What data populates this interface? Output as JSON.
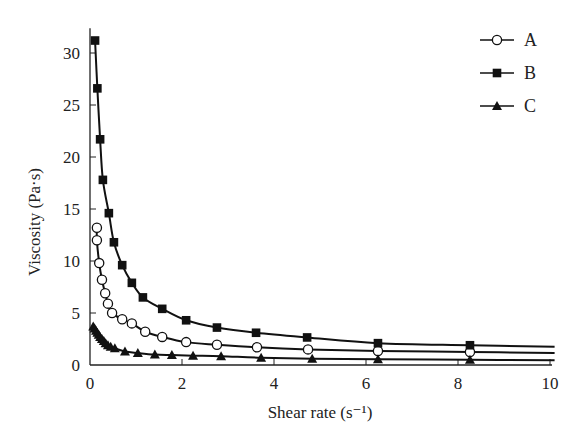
{
  "chart_data": {
    "type": "line",
    "title": "",
    "xlabel": "Shear rate (s⁻¹)",
    "ylabel": "Viscosity (Pa·s)",
    "xlim": [
      0,
      10
    ],
    "ylim": [
      0,
      32
    ],
    "xticks": [
      0,
      2,
      4,
      6,
      8,
      10
    ],
    "yticks": [
      0,
      5,
      10,
      15,
      20,
      25,
      30
    ],
    "xtick_labels": [
      "0",
      "2",
      "4",
      "6",
      "8",
      "10"
    ],
    "ytick_labels": [
      "0",
      "5",
      "10",
      "15",
      "20",
      "25",
      "30"
    ],
    "grid": false,
    "legend_position": "top-right",
    "series": [
      {
        "name": "A",
        "marker": "open-circle",
        "x": [
          0.15,
          0.15,
          0.2,
          0.26,
          0.33,
          0.39,
          0.48,
          0.7,
          0.91,
          1.2,
          1.57,
          2.09,
          2.76,
          3.63,
          4.74,
          6.26,
          8.26
        ],
        "y": [
          13.2,
          12.0,
          9.8,
          8.2,
          6.9,
          5.9,
          5.0,
          4.4,
          4.0,
          3.2,
          2.7,
          2.2,
          1.95,
          1.7,
          1.5,
          1.35,
          1.25
        ],
        "curve_end": [
          10.1,
          1.15
        ]
      },
      {
        "name": "B",
        "marker": "filled-square",
        "x": [
          0.11,
          0.16,
          0.22,
          0.28,
          0.41,
          0.52,
          0.7,
          0.91,
          1.15,
          1.57,
          2.09,
          2.76,
          3.61,
          4.72,
          6.26,
          8.26
        ],
        "y": [
          31.2,
          26.6,
          21.7,
          17.8,
          14.6,
          11.8,
          9.6,
          7.9,
          6.5,
          5.4,
          4.3,
          3.6,
          3.1,
          2.65,
          2.1,
          1.9
        ],
        "curve_end": [
          10.1,
          1.75
        ]
      },
      {
        "name": "C",
        "marker": "filled-triangle",
        "x": [
          0.07,
          0.1,
          0.13,
          0.16,
          0.19,
          0.22,
          0.26,
          0.3,
          0.34,
          0.39,
          0.45,
          0.54,
          0.76,
          1.04,
          1.41,
          1.78,
          2.24,
          2.85,
          3.72,
          4.83,
          6.26,
          8.26
        ],
        "y": [
          3.7,
          3.5,
          3.3,
          3.1,
          2.9,
          2.7,
          2.5,
          2.3,
          2.1,
          1.9,
          1.75,
          1.6,
          1.3,
          1.15,
          1.0,
          0.95,
          0.9,
          0.85,
          0.7,
          0.6,
          0.55,
          0.5
        ],
        "curve_end": [
          10.1,
          0.45
        ]
      }
    ]
  }
}
